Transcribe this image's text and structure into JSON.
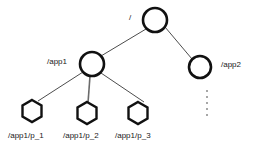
{
  "diagram": {
    "type": "tree",
    "title": "",
    "nodes": [
      {
        "id": "root",
        "label": "/",
        "shape": "circle",
        "cx": 155,
        "cy": 20,
        "r": 12,
        "label_pos": "left"
      },
      {
        "id": "app1",
        "label": "/app1",
        "shape": "circle",
        "cx": 92,
        "cy": 64,
        "r": 12,
        "label_pos": "left"
      },
      {
        "id": "app2",
        "label": "/app2",
        "shape": "circle",
        "cx": 200,
        "cy": 67,
        "r": 11,
        "label_pos": "right"
      },
      {
        "id": "p1",
        "label": "/app1/p_1",
        "shape": "hexagon",
        "cx": 32,
        "cy": 111,
        "r": 11,
        "label_pos": "below"
      },
      {
        "id": "p2",
        "label": "/app1/p_2",
        "shape": "hexagon",
        "cx": 87,
        "cy": 113,
        "r": 11,
        "label_pos": "below"
      },
      {
        "id": "p3",
        "label": "/app1/p_3",
        "shape": "hexagon",
        "cx": 138,
        "cy": 113,
        "r": 11,
        "label_pos": "below"
      }
    ],
    "edges": [
      {
        "from": "root",
        "to": "app1"
      },
      {
        "from": "root",
        "to": "app2"
      },
      {
        "from": "app1",
        "to": "p1"
      },
      {
        "from": "app1",
        "to": "p2"
      },
      {
        "from": "app1",
        "to": "p3"
      }
    ],
    "ellipsis": {
      "orientation": "vertical",
      "dots": 5,
      "x": 207,
      "y": 103
    },
    "colors": {
      "node_stroke": "#111111",
      "edge_stroke": "#4d4d4d",
      "label_text": "#1a1a1a",
      "background": "#ffffff",
      "ellipsis_dot": "#8a8a8a"
    }
  }
}
